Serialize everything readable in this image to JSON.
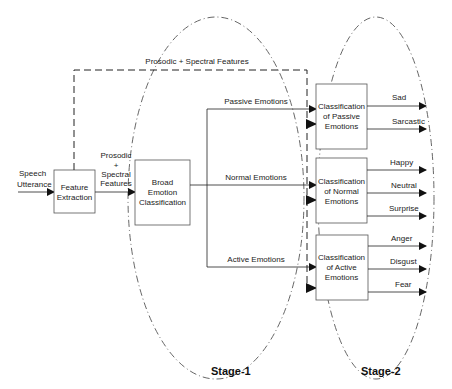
{
  "diagram": {
    "input": {
      "label_line1": "Speech",
      "label_line2": "Utterance"
    },
    "feature_extraction": {
      "line1": "Feature",
      "line2": "Extraction"
    },
    "feature_edge": {
      "line1": "Prosodic",
      "line2": "+",
      "line3": "Spectral",
      "line4": "Features"
    },
    "feedback_edge": {
      "label": "Prosodic + Spectral  Features"
    },
    "broad_classifier": {
      "line1": "Broad",
      "line2": "Emotion",
      "line3": "Classification"
    },
    "branches": {
      "passive": "Passive Emotions",
      "normal": "Normal Emotions",
      "active": "Active Emotions"
    },
    "stage2": {
      "passive": {
        "line1": "Classification",
        "line2": "of Passive",
        "line3": "Emotions",
        "outputs": [
          "Sad",
          "Sarcastic"
        ]
      },
      "normal": {
        "line1": "Classification",
        "line2": "of Normal",
        "line3": "Emotions",
        "outputs": [
          "Happy",
          "Neutral",
          "Surprise"
        ]
      },
      "active": {
        "line1": "Classification",
        "line2": "of Active",
        "line3": "Emotions",
        "outputs": [
          "Anger",
          "Disgust",
          "Fear"
        ]
      }
    },
    "stages": {
      "stage1": "Stage-1",
      "stage2": "Stage-2"
    }
  }
}
